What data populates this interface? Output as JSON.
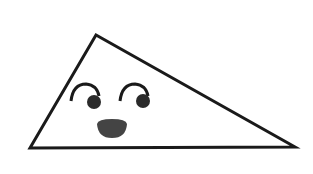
{
  "figure": {
    "description": "Cartoon triangle with a face",
    "colors": {
      "background": "#ffffff",
      "outline": "#1a1a1a",
      "fill": "#ffffff",
      "pupil": "#2a2a2a",
      "nose": "#444444"
    },
    "triangle": {
      "points": "96,35 30,148 295,147",
      "stroke_width": 3
    },
    "left_eye": {
      "brow_path": "M 71 101 Q 73 84 86 84 Q 97 85 99 96",
      "pupil": {
        "cx": 94,
        "cy": 102,
        "r": 7
      }
    },
    "right_eye": {
      "brow_path": "M 120 101 Q 122 84 135 84 Q 146 85 148 96",
      "pupil": {
        "cx": 143,
        "cy": 101,
        "r": 7
      }
    },
    "nose": {
      "path": "M 97 124 Q 98 119 112 119 Q 126 119 127 124 Q 126 138 112 138 Q 98 138 97 124 Z"
    }
  }
}
